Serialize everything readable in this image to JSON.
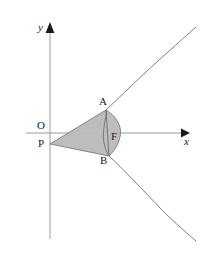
{
  "figure": {
    "background_color": "#ffffff",
    "shade_color": "#b9b9b9",
    "curve_color": "#6e6e6e",
    "axis_color": "#9a9a9a",
    "label_color": "#1a1a1a",
    "axes": {
      "x_axis_label": "x",
      "y_axis_label": "y",
      "origin_label": "O"
    },
    "points": [
      {
        "id": "O",
        "label": "O",
        "x": 50,
        "y": 133,
        "desc": "origin"
      },
      {
        "id": "P",
        "label": "P",
        "x": 50,
        "y": 144,
        "desc": "point on y-axis below origin, apex of shaded region"
      },
      {
        "id": "A",
        "label": "A",
        "x": 106,
        "y": 110,
        "desc": "upper intersection of chord with parabola"
      },
      {
        "id": "F",
        "label": "F",
        "x": 119,
        "y": 133,
        "desc": "focus on x-axis"
      },
      {
        "id": "B",
        "label": "B",
        "x": 109,
        "y": 156,
        "desc": "lower intersection of chord with parabola"
      }
    ],
    "curves": [
      {
        "id": "parabola",
        "type": "parabola",
        "opens": "right",
        "vertex_on": "y-axis near origin"
      }
    ],
    "shaded_region": {
      "vertices": [
        "P",
        "A",
        "B"
      ],
      "arc_between": [
        "A",
        "B"
      ],
      "description": "Region bounded by segments PA, PB and the parabolic arc from A to B"
    }
  }
}
